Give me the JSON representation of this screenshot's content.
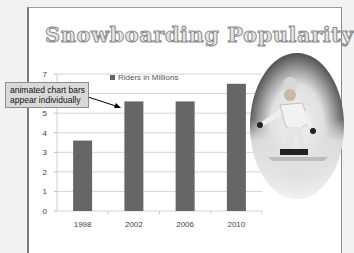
{
  "slide": {
    "title": "Snowboarding Popularity",
    "photo_description": "snowboarder in oval frame",
    "callout": {
      "line1": "animated chart bars",
      "line2": "appear individually"
    }
  },
  "chart_data": {
    "type": "bar",
    "title": "",
    "categories": [
      "1998",
      "2002",
      "2006",
      "2010"
    ],
    "series": [
      {
        "name": "Riders in Millions",
        "values": [
          3.6,
          5.6,
          5.6,
          6.5
        ],
        "color": "#666666"
      }
    ],
    "xlabel": "",
    "ylabel": "",
    "ylim": [
      0,
      7
    ],
    "yticks": [
      0,
      1,
      2,
      3,
      4,
      5,
      6,
      7
    ],
    "grid": true,
    "legend": "top"
  }
}
